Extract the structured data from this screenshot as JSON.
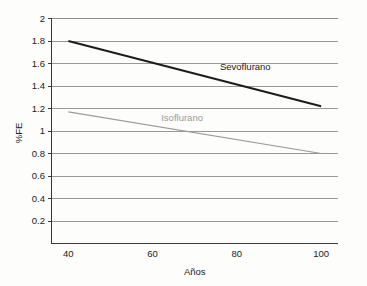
{
  "chart_data": {
    "type": "line",
    "title": "",
    "xlabel": "Años",
    "ylabel": "%FE",
    "xlim": [
      36,
      104
    ],
    "ylim": [
      0,
      2
    ],
    "xticks": [
      "40",
      "60",
      "80",
      "100"
    ],
    "xtick_values": [
      40,
      60,
      80,
      100
    ],
    "yticks": [
      "0.2",
      "0.4",
      "0.6",
      "0.8",
      "1",
      "1.2",
      "1.4",
      "1.6",
      "1.8",
      "2"
    ],
    "ytick_values": [
      0.2,
      0.4,
      0.6,
      0.8,
      1.0,
      1.2,
      1.4,
      1.6,
      1.8,
      2.0
    ],
    "grid": "horizontal",
    "legend": "inline-labels",
    "series": [
      {
        "name": "Sevoflurano",
        "color": "#1c1c1c",
        "width": 1.9,
        "x": [
          40,
          100
        ],
        "values": [
          1.8,
          1.22
        ],
        "label_x": 82,
        "label_y": 1.54
      },
      {
        "name": "Isoflurano",
        "color": "#9a9a9a",
        "width": 1.2,
        "x": [
          40,
          100
        ],
        "values": [
          1.17,
          0.8
        ],
        "label_x": 67,
        "label_y": 1.09
      }
    ]
  },
  "style": {
    "background": "#fdfdfc",
    "axis_color": "#3a3a3a",
    "grid_color": "#8e8e8e",
    "tick_text_color": "#1a1a1a"
  }
}
